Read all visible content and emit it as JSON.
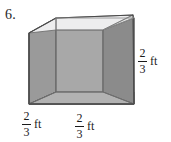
{
  "problem": {
    "number": "6."
  },
  "figure": {
    "name": "open-top-cube",
    "shape_type": "cube",
    "labels": [
      {
        "id": "right-height",
        "numerator": "2",
        "denominator": "3",
        "unit": "ft",
        "edge": "vertical-right"
      },
      {
        "id": "bottom-left-depth",
        "numerator": "2",
        "denominator": "3",
        "unit": "ft",
        "edge": "bottom-left-depth"
      },
      {
        "id": "bottom-front-width",
        "numerator": "2",
        "denominator": "3",
        "unit": "ft",
        "edge": "bottom-front-width"
      }
    ]
  },
  "colors": {
    "background": "#ffffff",
    "ink": "#1b1b1b",
    "outline": "#4f4f4f",
    "top_rim": "#eceded",
    "left_face": "#9a9a9a",
    "right_face": "#8f8f8f",
    "interior_back": "#a9a9a9",
    "interior_right": "#8b8b8b",
    "interior_floor": "#b4b4b4",
    "rim_edge": "#f4f4f4"
  }
}
